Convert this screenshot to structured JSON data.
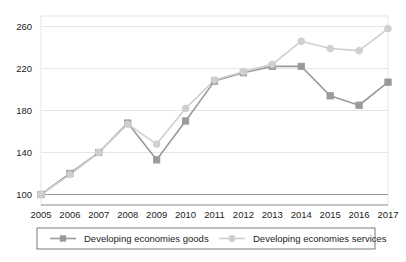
{
  "chart_data": {
    "type": "line",
    "title": "",
    "subtitle": "",
    "xlabel": "",
    "ylabel": "",
    "categories": [
      "2005",
      "2006",
      "2007",
      "2008",
      "2009",
      "2010",
      "2011",
      "2012",
      "2013",
      "2014",
      "2015",
      "2016",
      "2017"
    ],
    "x": [
      2005,
      2006,
      2007,
      2008,
      2009,
      2010,
      2011,
      2012,
      2013,
      2014,
      2015,
      2016,
      2017
    ],
    "series": [
      {
        "name": "Developing economies goods",
        "marker": "square",
        "color": "#9a9a9a",
        "values": [
          100,
          120,
          140,
          168,
          133,
          170,
          208,
          216,
          222,
          222,
          194,
          185,
          207
        ]
      },
      {
        "name": "Developing economies services",
        "marker": "circle",
        "color": "#cfcfcf",
        "values": [
          100,
          119,
          140,
          167,
          148,
          182,
          209,
          217,
          224,
          246,
          239,
          237,
          258
        ]
      }
    ],
    "ylim": [
      90,
      270
    ],
    "yticks": [
      100,
      140,
      180,
      220,
      260
    ],
    "ytick_labels": [
      "100",
      "140",
      "180",
      "220",
      "260"
    ],
    "grid": true,
    "grid_color": "#e2e2e2",
    "legend_position": "bottom",
    "axis_color": "#8c8c8c",
    "text_color": "#1d1d1d"
  },
  "legend": {
    "items": [
      {
        "label": "Developing economies goods"
      },
      {
        "label": "Developing economies services"
      }
    ]
  }
}
